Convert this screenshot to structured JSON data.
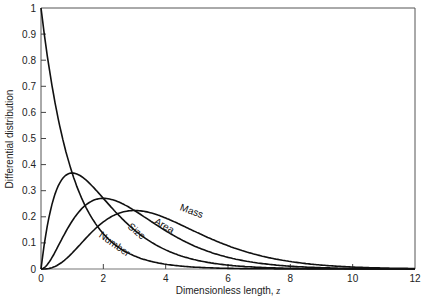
{
  "chart_data": {
    "type": "line",
    "title": "",
    "xlabel": "Dimensionless length, z",
    "ylabel": "Differential distribution",
    "xlim": [
      0,
      12
    ],
    "ylim": [
      0,
      1
    ],
    "grid": false,
    "legend": "none (curves labeled inline)",
    "x_ticks": [
      "0",
      "2",
      "4",
      "6",
      "8",
      "10",
      "12"
    ],
    "y_ticks": [
      "0",
      "0.1",
      "0.2",
      "0.3",
      "0.4",
      "0.5",
      "0.6",
      "0.7",
      "0.8",
      "0.9",
      "1"
    ],
    "x": [
      0,
      0.5,
      1,
      1.5,
      2,
      2.5,
      3,
      3.5,
      4,
      5,
      6,
      7,
      8,
      9,
      10,
      11,
      12
    ],
    "series": [
      {
        "name": "Number",
        "values": [
          1.0,
          0.607,
          0.368,
          0.223,
          0.135,
          0.082,
          0.05,
          0.03,
          0.018,
          0.007,
          0.002,
          0.001,
          0.0,
          0.0,
          0.0,
          0.0,
          0.0
        ]
      },
      {
        "name": "Size",
        "values": [
          0.0,
          0.303,
          0.368,
          0.335,
          0.271,
          0.205,
          0.149,
          0.106,
          0.073,
          0.034,
          0.015,
          0.006,
          0.003,
          0.001,
          0.0,
          0.0,
          0.0
        ]
      },
      {
        "name": "Area",
        "values": [
          0.0,
          0.076,
          0.184,
          0.251,
          0.271,
          0.257,
          0.224,
          0.185,
          0.147,
          0.084,
          0.045,
          0.022,
          0.011,
          0.005,
          0.002,
          0.001,
          0.0
        ]
      },
      {
        "name": "Mass",
        "values": [
          0.0,
          0.013,
          0.061,
          0.126,
          0.18,
          0.214,
          0.224,
          0.216,
          0.195,
          0.14,
          0.089,
          0.052,
          0.029,
          0.015,
          0.008,
          0.004,
          0.002
        ]
      }
    ],
    "annotations": [
      {
        "text": "Number",
        "x": 2.3,
        "y": 0.085,
        "rotation": 35
      },
      {
        "text": "Size",
        "x": 3.0,
        "y": 0.135,
        "rotation": 40
      },
      {
        "text": "Area",
        "x": 3.9,
        "y": 0.155,
        "rotation": 30
      },
      {
        "text": "Mass",
        "x": 4.8,
        "y": 0.21,
        "rotation": 20
      }
    ]
  },
  "labels": {
    "xlabel_main": "Dimensionless length, ",
    "xlabel_var": "z",
    "ylabel": "Differential distribution"
  }
}
